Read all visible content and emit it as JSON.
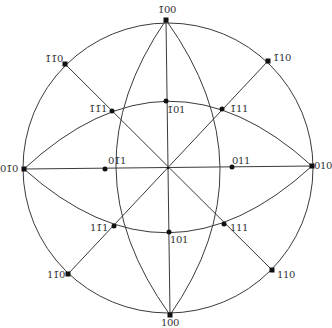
{
  "diagram": {
    "type": "stereographic-projection",
    "center": [
      168,
      168
    ],
    "radius": 145,
    "line_color": "#3a3a3a",
    "pole_color": "#111111",
    "poles": [
      {
        "id": "m100",
        "label": "1̅00",
        "display": "1̄00",
        "x": 166,
        "y": 20,
        "lx": 158,
        "ly": 5
      },
      {
        "id": "p100",
        "label": "100",
        "display": "100",
        "x": 170,
        "y": 315,
        "lx": 162,
        "ly": 318
      },
      {
        "id": "p010",
        "label": "010",
        "display": "010",
        "x": 312,
        "y": 166,
        "lx": 314,
        "ly": 161
      },
      {
        "id": "m010",
        "label": "01̄0",
        "display": "01̄0",
        "x": 24,
        "y": 169,
        "lx": 0,
        "ly": 164
      },
      {
        "id": "mm110",
        "label": "1̄1̄0",
        "display": "1̄1̄0",
        "x": 65,
        "y": 64,
        "lx": 45,
        "ly": 54
      },
      {
        "id": "m110",
        "label": "1̄10",
        "display": "1̄10",
        "x": 268,
        "y": 61,
        "lx": 273,
        "ly": 53
      },
      {
        "id": "pm110",
        "label": "11̄0",
        "display": "11̄0",
        "x": 68,
        "y": 274,
        "lx": 47,
        "ly": 270
      },
      {
        "id": "p110",
        "label": "110",
        "display": "110",
        "x": 272,
        "y": 270,
        "lx": 277,
        "ly": 270
      },
      {
        "id": "mm111",
        "label": "1̄1̄1",
        "display": "1̄1̄1",
        "x": 112,
        "y": 111,
        "lx": 89,
        "ly": 104
      },
      {
        "id": "m111",
        "label": "1̄11",
        "display": "1̄11",
        "x": 222,
        "y": 109,
        "lx": 230,
        "ly": 104
      },
      {
        "id": "pm111",
        "label": "11̄1",
        "display": "11̄1",
        "x": 114,
        "y": 226,
        "lx": 90,
        "ly": 223
      },
      {
        "id": "p111",
        "label": "111",
        "display": "111",
        "x": 224,
        "y": 224,
        "lx": 230,
        "ly": 223
      },
      {
        "id": "m101",
        "label": "1̄01",
        "display": "1̄01",
        "x": 166,
        "y": 101,
        "lx": 167,
        "ly": 105
      },
      {
        "id": "p101",
        "label": "101",
        "display": "101",
        "x": 169,
        "y": 232,
        "lx": 170,
        "ly": 235
      },
      {
        "id": "m011",
        "label": "01̄1",
        "display": "01̄1",
        "x": 105,
        "y": 169,
        "lx": 108,
        "ly": 156
      },
      {
        "id": "p011",
        "label": "011",
        "display": "011",
        "x": 232,
        "y": 167,
        "lx": 232,
        "ly": 156
      }
    ]
  }
}
